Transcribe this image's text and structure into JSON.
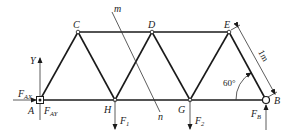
{
  "diagram": {
    "type": "truss",
    "nodes": {
      "A": {
        "label": "A",
        "x": 40,
        "y": 100
      },
      "H": {
        "label": "H",
        "x": 115,
        "y": 100
      },
      "G": {
        "label": "G",
        "x": 190,
        "y": 100
      },
      "B": {
        "label": "B",
        "x": 266,
        "y": 100
      },
      "C": {
        "label": "C",
        "x": 78,
        "y": 32
      },
      "D": {
        "label": "D",
        "x": 152,
        "y": 32
      },
      "E": {
        "label": "E",
        "x": 229,
        "y": 32
      }
    },
    "members": [
      [
        "A",
        "C"
      ],
      [
        "C",
        "H"
      ],
      [
        "H",
        "D"
      ],
      [
        "D",
        "G"
      ],
      [
        "G",
        "E"
      ],
      [
        "E",
        "B"
      ],
      [
        "C",
        "D"
      ],
      [
        "D",
        "E"
      ],
      [
        "A",
        "H"
      ],
      [
        "H",
        "G"
      ],
      [
        "G",
        "B"
      ]
    ],
    "section_line": {
      "top_label": "m",
      "bottom_label": "n"
    },
    "axis": {
      "y_label": "Y"
    },
    "forces": {
      "F_AX": {
        "main": "F",
        "sub": "AX"
      },
      "F_AY": {
        "main": "F",
        "sub": "AY"
      },
      "F_1": {
        "main": "F",
        "sub": "1"
      },
      "F_2": {
        "main": "F",
        "sub": "2"
      },
      "F_B": {
        "main": "F",
        "sub": "B"
      }
    },
    "dimension": {
      "length_label": "1m"
    },
    "angle": {
      "label": "60°"
    }
  }
}
